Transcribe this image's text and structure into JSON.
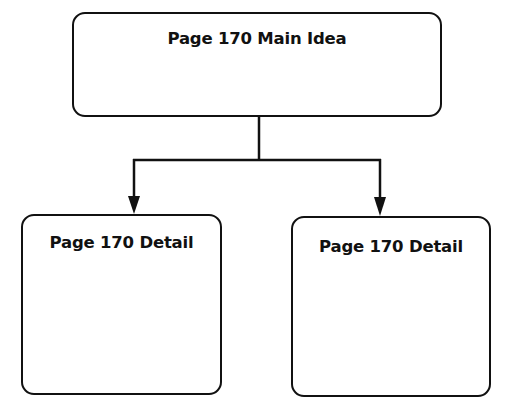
{
  "diagram": {
    "type": "tree",
    "main_idea": {
      "label": "Page 170 Main Idea"
    },
    "details": [
      {
        "label": "Page 170 Detail"
      },
      {
        "label": "Page 170 Detail"
      }
    ],
    "colors": {
      "stroke": "#111111",
      "background": "#ffffff",
      "text": "#111111"
    }
  }
}
